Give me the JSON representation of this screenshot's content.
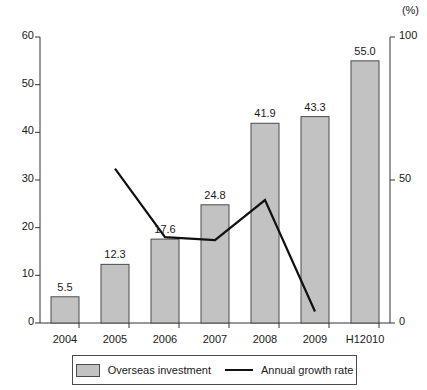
{
  "chart_data": {
    "type": "bar",
    "title": "",
    "subtitle": "",
    "xlabel": "",
    "ylabel": "",
    "categories": [
      "2004",
      "2005",
      "2006",
      "2007",
      "2008",
      "2009",
      "H12010"
    ],
    "series": [
      {
        "name": "Overseas investment",
        "type": "bar",
        "axis": "left",
        "values": [
          5.5,
          12.3,
          17.6,
          24.8,
          41.9,
          43.3,
          55.0
        ],
        "labels": [
          "5.5",
          "12.3",
          "17.6",
          "24.8",
          "41.9",
          "43.3",
          "55.0"
        ],
        "color": "#c2c2c2",
        "edge_color": "#4a4a4a"
      },
      {
        "name": "Annual growth rate",
        "type": "line",
        "axis": "right",
        "x": [
          "2005",
          "2006",
          "2007",
          "2008",
          "2009"
        ],
        "values": [
          54,
          30,
          29,
          43,
          4
        ],
        "color": "#111111"
      }
    ],
    "left_axis": {
      "ticks": [
        "0",
        "10",
        "20",
        "30",
        "40",
        "50",
        "60"
      ],
      "values": [
        0,
        10,
        20,
        30,
        40,
        50,
        60
      ],
      "ylim": [
        0,
        60
      ],
      "unit": ""
    },
    "right_axis": {
      "ticks": [
        "0",
        "50",
        "100"
      ],
      "values": [
        0,
        50,
        100
      ],
      "ylim": [
        0,
        100
      ],
      "unit": "(%)"
    },
    "grid": false,
    "legend_position": "bottom",
    "legend": [
      {
        "label": "Overseas investment",
        "marker": "square-swatch"
      },
      {
        "label": "Annual growth rate",
        "marker": "line"
      }
    ]
  }
}
